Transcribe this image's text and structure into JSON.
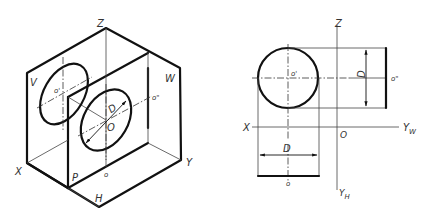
{
  "figure": {
    "left_view": {
      "title": "Isometric projection box with circle",
      "labels": {
        "z": "Z",
        "v": "V",
        "w": "W",
        "x": "X",
        "y": "Y",
        "h": "H",
        "p": "P",
        "o_prime": "o'",
        "o_double_prime": "o\"",
        "o": "o",
        "center": "O",
        "diameter": "D"
      }
    },
    "right_view": {
      "title": "Orthographic three-view projection of circle",
      "labels": {
        "z": "Z",
        "x": "X",
        "yw": "Y",
        "yw_sub": "W",
        "yh": "Y",
        "yh_sub": "H",
        "origin": "O",
        "o_prime": "o'",
        "o_double_prime": "o\"",
        "o": "o",
        "diameter_h": "D",
        "diameter_v": "D"
      }
    },
    "colors": {
      "line": "#111111",
      "thin": "#444444",
      "background": "#ffffff"
    }
  }
}
